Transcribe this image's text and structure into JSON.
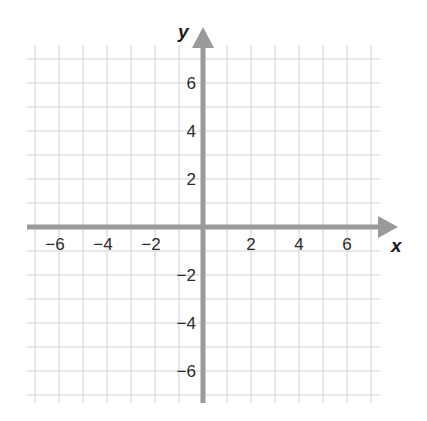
{
  "chart_data": {
    "type": "coordinate-plane",
    "title": "",
    "xlabel": "x",
    "ylabel": "y",
    "xlim": [
      -7,
      7
    ],
    "ylim": [
      -7,
      7
    ],
    "grid": true,
    "grid_step": 1,
    "x_ticks": [
      -6,
      -4,
      -2,
      2,
      4,
      6
    ],
    "y_ticks": [
      6,
      4,
      2,
      -2,
      -4,
      -6
    ],
    "x_tick_labels": [
      "−6",
      "−4",
      "−2",
      "2",
      "4",
      "6"
    ],
    "y_tick_labels": [
      "6",
      "4",
      "2",
      "−2",
      "−4",
      "−6"
    ],
    "series": [],
    "colors": {
      "grid": "#e2e2e2",
      "axis": "#9a9a9a",
      "text": "#2a2a2a"
    }
  }
}
